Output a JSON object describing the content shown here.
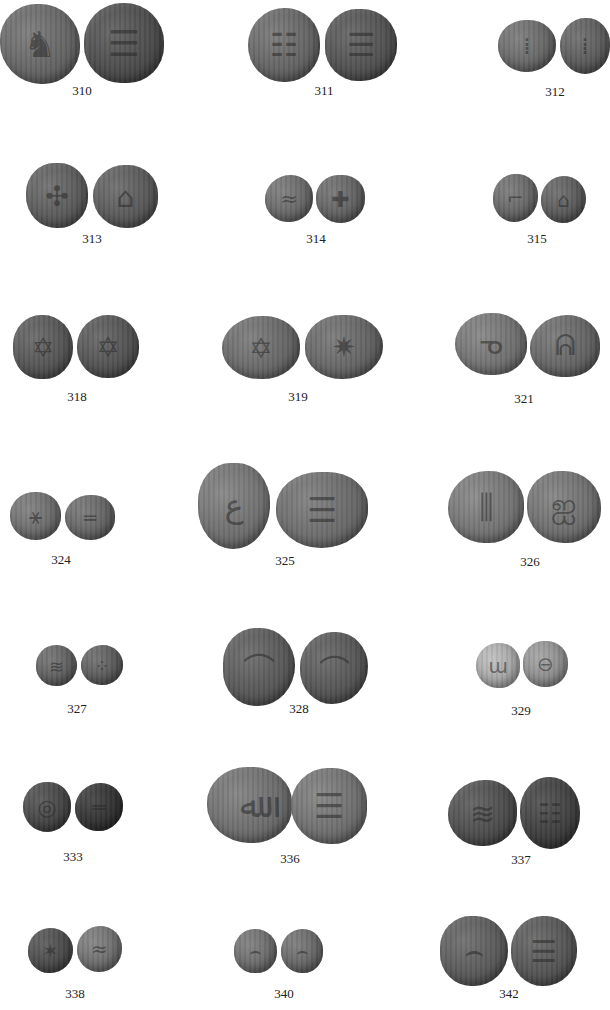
{
  "plate": {
    "background": "#ffffff",
    "items": [
      {
        "number": "310",
        "label_x": 82,
        "label_y": 92,
        "coins": [
          {
            "x": 0,
            "y": 4,
            "w": 80,
            "h": 80,
            "color": "#6b6b6b",
            "glyph": "♞"
          },
          {
            "x": 84,
            "y": 3,
            "w": 80,
            "h": 80,
            "color": "#4e4e4e",
            "glyph": "☰"
          }
        ]
      },
      {
        "number": "311",
        "label_x": 324,
        "label_y": 92,
        "coins": [
          {
            "x": 248,
            "y": 8,
            "w": 72,
            "h": 74,
            "color": "#6a6a6a",
            "glyph": "☷"
          },
          {
            "x": 325,
            "y": 9,
            "w": 72,
            "h": 72,
            "color": "#545454",
            "glyph": "☰"
          }
        ]
      },
      {
        "number": "312",
        "label_x": 555,
        "label_y": 93,
        "coins": [
          {
            "x": 498,
            "y": 20,
            "w": 58,
            "h": 52,
            "color": "#6e6e6e",
            "glyph": "⁞"
          },
          {
            "x": 560,
            "y": 18,
            "w": 50,
            "h": 56,
            "color": "#5f5f5f",
            "glyph": "⁞"
          }
        ]
      },
      {
        "number": "313",
        "label_x": 92,
        "label_y": 240,
        "coins": [
          {
            "x": 26,
            "y": 163,
            "w": 62,
            "h": 65,
            "color": "#5f5f5f",
            "glyph": "✣"
          },
          {
            "x": 93,
            "y": 165,
            "w": 65,
            "h": 63,
            "color": "#5d5d5d",
            "glyph": "⌂"
          }
        ]
      },
      {
        "number": "314",
        "label_x": 316,
        "label_y": 240,
        "coins": [
          {
            "x": 265,
            "y": 175,
            "w": 48,
            "h": 47,
            "color": "#6f6f6f",
            "glyph": "≈"
          },
          {
            "x": 316,
            "y": 175,
            "w": 49,
            "h": 48,
            "color": "#676767",
            "glyph": "✚"
          }
        ]
      },
      {
        "number": "315",
        "label_x": 537,
        "label_y": 240,
        "coins": [
          {
            "x": 493,
            "y": 174,
            "w": 45,
            "h": 48,
            "color": "#6c6c6c",
            "glyph": "⌐"
          },
          {
            "x": 541,
            "y": 176,
            "w": 45,
            "h": 47,
            "color": "#5e5e5e",
            "glyph": "⌂"
          }
        ]
      },
      {
        "number": "318",
        "label_x": 77,
        "label_y": 398,
        "coins": [
          {
            "x": 13,
            "y": 315,
            "w": 60,
            "h": 64,
            "color": "#585858",
            "glyph": "✡"
          },
          {
            "x": 77,
            "y": 315,
            "w": 62,
            "h": 63,
            "color": "#555555",
            "glyph": "✡"
          }
        ]
      },
      {
        "number": "319",
        "label_x": 298,
        "label_y": 398,
        "coins": [
          {
            "x": 222,
            "y": 316,
            "w": 78,
            "h": 63,
            "color": "#6e6e6e",
            "glyph": "✡"
          },
          {
            "x": 305,
            "y": 315,
            "w": 78,
            "h": 64,
            "color": "#6a6a6a",
            "glyph": "✷"
          }
        ]
      },
      {
        "number": "321",
        "label_x": 524,
        "label_y": 400,
        "coins": [
          {
            "x": 455,
            "y": 313,
            "w": 72,
            "h": 62,
            "color": "#797979",
            "glyph": "ᓀ"
          },
          {
            "x": 530,
            "y": 315,
            "w": 70,
            "h": 62,
            "color": "#6a6a6a",
            "glyph": "ᕱ"
          }
        ]
      },
      {
        "number": "324",
        "label_x": 61,
        "label_y": 561,
        "coins": [
          {
            "x": 10,
            "y": 492,
            "w": 51,
            "h": 48,
            "color": "#737373",
            "glyph": "⚹"
          },
          {
            "x": 65,
            "y": 495,
            "w": 50,
            "h": 45,
            "color": "#6a6a6a",
            "glyph": "═"
          }
        ]
      },
      {
        "number": "325",
        "label_x": 285,
        "label_y": 562,
        "coins": [
          {
            "x": 198,
            "y": 463,
            "w": 72,
            "h": 86,
            "color": "#787878",
            "glyph": "ع"
          },
          {
            "x": 276,
            "y": 472,
            "w": 92,
            "h": 76,
            "color": "#727272",
            "glyph": "☰"
          }
        ]
      },
      {
        "number": "326",
        "label_x": 530,
        "label_y": 563,
        "coins": [
          {
            "x": 448,
            "y": 471,
            "w": 76,
            "h": 72,
            "color": "#7c7c7c",
            "glyph": "⫼"
          },
          {
            "x": 527,
            "y": 471,
            "w": 74,
            "h": 72,
            "color": "#767676",
            "glyph": "ஐ"
          }
        ]
      },
      {
        "number": "327",
        "label_x": 77,
        "label_y": 710,
        "coins": [
          {
            "x": 36,
            "y": 645,
            "w": 41,
            "h": 41,
            "color": "#646464",
            "glyph": "≋"
          },
          {
            "x": 81,
            "y": 645,
            "w": 42,
            "h": 40,
            "color": "#5f5f5f",
            "glyph": "⁘"
          }
        ]
      },
      {
        "number": "328",
        "label_x": 299,
        "label_y": 710,
        "coins": [
          {
            "x": 223,
            "y": 628,
            "w": 72,
            "h": 78,
            "color": "#5c5c5c",
            "glyph": "⌒"
          },
          {
            "x": 300,
            "y": 632,
            "w": 68,
            "h": 72,
            "color": "#595959",
            "glyph": "⌒"
          }
        ]
      },
      {
        "number": "329",
        "label_x": 521,
        "label_y": 712,
        "coins": [
          {
            "x": 476,
            "y": 643,
            "w": 44,
            "h": 45,
            "color": "#b9b9b9",
            "glyph": "ɯ"
          },
          {
            "x": 523,
            "y": 641,
            "w": 45,
            "h": 46,
            "color": "#9b9b9b",
            "glyph": "⊖"
          }
        ]
      },
      {
        "number": "333",
        "label_x": 73,
        "label_y": 858,
        "coins": [
          {
            "x": 23,
            "y": 782,
            "w": 48,
            "h": 50,
            "color": "#454545",
            "glyph": "◎"
          },
          {
            "x": 75,
            "y": 783,
            "w": 48,
            "h": 48,
            "color": "#2f2f2f",
            "glyph": "═"
          }
        ]
      },
      {
        "number": "336",
        "label_x": 290,
        "label_y": 860,
        "coins": [
          {
            "x": 207,
            "y": 767,
            "w": 85,
            "h": 76,
            "color": "#747474",
            "glyph": "ﷲ"
          },
          {
            "x": 291,
            "y": 768,
            "w": 76,
            "h": 76,
            "color": "#777777",
            "glyph": "☰"
          }
        ]
      },
      {
        "number": "337",
        "label_x": 521,
        "label_y": 861,
        "coins": [
          {
            "x": 448,
            "y": 780,
            "w": 69,
            "h": 66,
            "color": "#4e4e4e",
            "glyph": "≋"
          },
          {
            "x": 520,
            "y": 777,
            "w": 60,
            "h": 72,
            "color": "#3e3e3e",
            "glyph": "☷"
          }
        ]
      },
      {
        "number": "338",
        "label_x": 75,
        "label_y": 995,
        "coins": [
          {
            "x": 28,
            "y": 928,
            "w": 45,
            "h": 45,
            "color": "#4b4b4b",
            "glyph": "✶"
          },
          {
            "x": 77,
            "y": 926,
            "w": 45,
            "h": 46,
            "color": "#767676",
            "glyph": "≈"
          }
        ]
      },
      {
        "number": "340",
        "label_x": 284,
        "label_y": 995,
        "coins": [
          {
            "x": 234,
            "y": 929,
            "w": 43,
            "h": 44,
            "color": "#727272",
            "glyph": "⌢"
          },
          {
            "x": 281,
            "y": 929,
            "w": 42,
            "h": 44,
            "color": "#6d6d6d",
            "glyph": "⌢"
          }
        ]
      },
      {
        "number": "342",
        "label_x": 509,
        "label_y": 995,
        "coins": [
          {
            "x": 440,
            "y": 916,
            "w": 68,
            "h": 70,
            "color": "#5e5e5e",
            "glyph": "⌢"
          },
          {
            "x": 511,
            "y": 916,
            "w": 66,
            "h": 70,
            "color": "#585858",
            "glyph": "☰"
          }
        ]
      }
    ]
  }
}
